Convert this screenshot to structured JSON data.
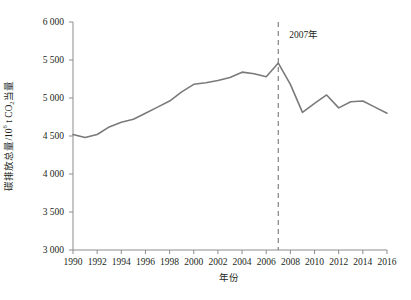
{
  "chart_data": {
    "type": "line",
    "title": "",
    "xlabel": "年份",
    "ylabel": "碳排放总量/10⁶ t CO₂当量",
    "ylabel_parts": {
      "main": "碳排放总量/10",
      "exponent": "6",
      "unit_mid": " t CO",
      "subscript": "2",
      "unit_tail": "当量"
    },
    "xlim": [
      1990,
      2016
    ],
    "ylim": [
      3000,
      6000
    ],
    "ytick_step": 500,
    "xtick_step": 2,
    "grid": false,
    "legend": false,
    "line_color": "#7a7a7a",
    "axis_color": "#8c8c8c",
    "text_color": "#231f20",
    "annotation_line_color": "#8c8c8c",
    "ytick_labels": [
      "6 000",
      "5 500",
      "5 000",
      "4 500",
      "4 000",
      "3 500",
      "3 000"
    ],
    "ytick_values": [
      6000,
      5500,
      5000,
      4500,
      4000,
      3500,
      3000
    ],
    "xtick_labels": [
      "1990",
      "1992",
      "1994",
      "1996",
      "1998",
      "2000",
      "2002",
      "2004",
      "2006",
      "2008",
      "2010",
      "2012",
      "2014",
      "2016"
    ],
    "xtick_values": [
      1990,
      1992,
      1994,
      1996,
      1998,
      2000,
      2002,
      2004,
      2006,
      2008,
      2010,
      2012,
      2014,
      2016
    ],
    "annotations": [
      {
        "label": "2007年",
        "type": "vertical-dashed-line",
        "x": 2007
      }
    ],
    "x": [
      1990,
      1991,
      1992,
      1993,
      1994,
      1995,
      1996,
      1997,
      1998,
      1999,
      2000,
      2001,
      2002,
      2003,
      2004,
      2005,
      2006,
      2007,
      2008,
      2009,
      2010,
      2011,
      2012,
      2013,
      2014,
      2015,
      2016
    ],
    "values": [
      4520,
      4480,
      4520,
      4620,
      4680,
      4720,
      4800,
      4880,
      4960,
      5080,
      5180,
      5200,
      5230,
      5270,
      5340,
      5320,
      5280,
      5460,
      5180,
      4810,
      4930,
      5040,
      4870,
      4950,
      4960,
      4880,
      4800
    ],
    "series": [
      {
        "name": "碳排放总量",
        "values": [
          4520,
          4480,
          4520,
          4620,
          4680,
          4720,
          4800,
          4880,
          4960,
          5080,
          5180,
          5200,
          5230,
          5270,
          5340,
          5320,
          5280,
          5460,
          5180,
          4810,
          4930,
          5040,
          4870,
          4950,
          4960,
          4880,
          4800
        ]
      }
    ]
  }
}
